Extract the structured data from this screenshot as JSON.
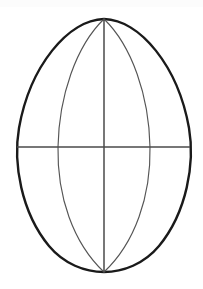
{
  "figure": {
    "title": "Egg outline with meridian and equator construction lines",
    "background_color": "#ffffff",
    "width": 203,
    "height": 289,
    "top_band_color": "#fcfcfc",
    "top_band_height": 7
  },
  "geometry": {
    "center_x": 104,
    "apex_top": {
      "x": 104,
      "y": 19
    },
    "apex_bottom": {
      "x": 104,
      "y": 272
    },
    "equator_y": 147,
    "outline": {
      "name": "egg-outline",
      "left_extent_x": 16,
      "right_extent_x": 190,
      "widest_y": 152,
      "stroke_color": "#1a1a1a",
      "stroke_width": 2.4,
      "path": "M 104 19 C 68 20 30 66 19 128 C 13 163 21 212 49 246 C 64 264 85 272 104 272 C 123 272 144 264 159 246 C 187 212 195 163 189 128 C 178 66 140 20 104 19 Z"
    },
    "lens_left_arc": {
      "name": "lens-left-arc",
      "widest_x": 58,
      "stroke_color": "#555555",
      "stroke_width": 1.15,
      "path": "M 104 19 C 76 46 59 96 58 147 C 57 196 73 243 104 272"
    },
    "lens_right_arc": {
      "name": "lens-right-arc",
      "widest_x": 150,
      "stroke_color": "#555555",
      "stroke_width": 1.15,
      "path": "M 104 19 C 132 46 149 96 150 147 C 151 196 135 243 104 272"
    },
    "vertical_axis": {
      "name": "vertical-axis",
      "x": 104,
      "y1": 19,
      "y2": 272,
      "stroke_color": "#4a4a4a",
      "stroke_width": 1.5
    },
    "horizontal_axis": {
      "name": "horizontal-axis",
      "y": 147,
      "x1": 17,
      "x2": 190,
      "stroke_color": "#4a4a4a",
      "stroke_width": 1.5
    }
  },
  "chart_data": {
    "type": "line",
    "title": "Egg outline with meridian and equator construction lines",
    "xlabel": "",
    "ylabel": "",
    "xlim": [
      0,
      203
    ],
    "ylim": [
      289,
      0
    ],
    "grid": false,
    "legend": "none",
    "series": [
      {
        "name": "egg-outline",
        "description": "Closed oval contour, pointed at the top apex and rounded at the bottom",
        "stroke": "#1a1a1a",
        "points": [
          [
            104,
            19
          ],
          [
            84,
            22
          ],
          [
            62,
            35
          ],
          [
            44,
            56
          ],
          [
            30,
            83
          ],
          [
            21,
            113
          ],
          [
            18,
            142
          ],
          [
            19,
            170
          ],
          [
            26,
            199
          ],
          [
            40,
            226
          ],
          [
            60,
            250
          ],
          [
            82,
            266
          ],
          [
            104,
            272
          ],
          [
            126,
            266
          ],
          [
            148,
            250
          ],
          [
            168,
            226
          ],
          [
            182,
            199
          ],
          [
            189,
            170
          ],
          [
            190,
            142
          ],
          [
            187,
            113
          ],
          [
            178,
            83
          ],
          [
            164,
            56
          ],
          [
            146,
            35
          ],
          [
            124,
            22
          ],
          [
            104,
            19
          ]
        ]
      },
      {
        "name": "lens-left-arc",
        "description": "Inner meridian arc bowing left from top apex to bottom apex",
        "stroke": "#555555",
        "points": [
          [
            104,
            19
          ],
          [
            92,
            32
          ],
          [
            81,
            51
          ],
          [
            72,
            74
          ],
          [
            65,
            99
          ],
          [
            60,
            124
          ],
          [
            58,
            147
          ],
          [
            58,
            173
          ],
          [
            62,
            199
          ],
          [
            70,
            224
          ],
          [
            83,
            249
          ],
          [
            94,
            263
          ],
          [
            104,
            272
          ]
        ]
      },
      {
        "name": "lens-right-arc",
        "description": "Inner meridian arc bowing right from top apex to bottom apex",
        "stroke": "#555555",
        "points": [
          [
            104,
            19
          ],
          [
            116,
            32
          ],
          [
            127,
            51
          ],
          [
            136,
            74
          ],
          [
            143,
            99
          ],
          [
            148,
            124
          ],
          [
            150,
            147
          ],
          [
            150,
            173
          ],
          [
            146,
            199
          ],
          [
            138,
            224
          ],
          [
            125,
            249
          ],
          [
            114,
            263
          ],
          [
            104,
            272
          ]
        ]
      },
      {
        "name": "vertical-axis",
        "description": "Central vertical line joining the two apexes",
        "stroke": "#4a4a4a",
        "points": [
          [
            104,
            19
          ],
          [
            104,
            272
          ]
        ]
      },
      {
        "name": "horizontal-axis",
        "description": "Equator line crossing the egg at its widest region",
        "stroke": "#4a4a4a",
        "points": [
          [
            17,
            147
          ],
          [
            190,
            147
          ]
        ]
      }
    ],
    "annotations": [
      {
        "label": "top apex",
        "x": 104,
        "y": 19
      },
      {
        "label": "bottom apex",
        "x": 104,
        "y": 272
      },
      {
        "label": "equator",
        "x": 104,
        "y": 147
      }
    ]
  }
}
